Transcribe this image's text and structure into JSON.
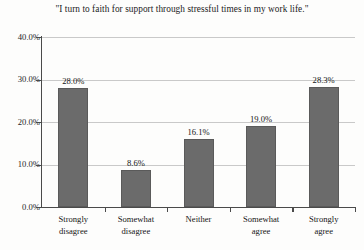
{
  "chart_data": {
    "type": "bar",
    "title": "\"I turn to faith for support through stressful times in my work life.\"",
    "xlabel": "",
    "ylabel": "",
    "categories": [
      "Strongly disagree",
      "Somewhat disagree",
      "Neither",
      "Somewhat agree",
      "Strongly agree"
    ],
    "category_lines": [
      [
        "Strongly",
        "disagree"
      ],
      [
        "Somewhat",
        "disagree"
      ],
      [
        "Neither",
        ""
      ],
      [
        "Somewhat",
        "agree"
      ],
      [
        "Strongly",
        "agree"
      ]
    ],
    "values": [
      28.0,
      8.6,
      16.1,
      19.0,
      28.3
    ],
    "value_labels": [
      "28.0%",
      "8.6%",
      "16.1%",
      "19.0%",
      "28.3%"
    ],
    "ylim": [
      0,
      40
    ],
    "y_ticks": [
      0,
      10,
      20,
      30,
      40
    ],
    "y_tick_labels": [
      "0.0%",
      "10.0%",
      "20.0%",
      "30.0%",
      "40.0%"
    ],
    "grid": true,
    "legend": null,
    "bar_color": "#6b6b6b",
    "gridline_color": "#c9c9c9",
    "axis_color": "#4a4a4a",
    "background_color": "#fdfdfc"
  }
}
